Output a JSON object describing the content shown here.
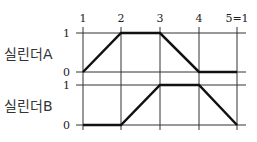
{
  "chart_data": {
    "type": "line",
    "title": "",
    "x_labels": [
      "1",
      "2",
      "3",
      "4",
      "5=1"
    ],
    "y_ticks": [
      "0",
      "1"
    ],
    "series": [
      {
        "name": "실린더A",
        "values": [
          0,
          1,
          1,
          0,
          0
        ]
      },
      {
        "name": "실린더B",
        "values": [
          0,
          0,
          1,
          1,
          0
        ]
      }
    ],
    "ylim": [
      0,
      1
    ],
    "grid": true
  }
}
